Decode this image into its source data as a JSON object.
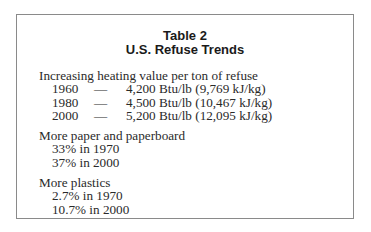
{
  "table": {
    "title": "Table 2",
    "subtitle": "U.S. Refuse Trends",
    "heating": {
      "heading": "Increasing heating value per ton of refuse",
      "rows": [
        {
          "year": "1960",
          "dash": "—",
          "value": "4,200 Btu/lb (9,769 kJ/kg)"
        },
        {
          "year": "1980",
          "dash": "—",
          "value": "4,500 Btu/lb (10,467 kJ/kg)"
        },
        {
          "year": "2000",
          "dash": "—",
          "value": "5,200 Btu/lb (12,095 kJ/kg)"
        }
      ]
    },
    "paper": {
      "heading": "More paper and paperboard",
      "items": [
        "33% in 1970",
        "37% in 2000"
      ]
    },
    "plastics": {
      "heading": "More plastics",
      "items": [
        "2.7% in 1970",
        "10.7% in 2000"
      ]
    }
  }
}
